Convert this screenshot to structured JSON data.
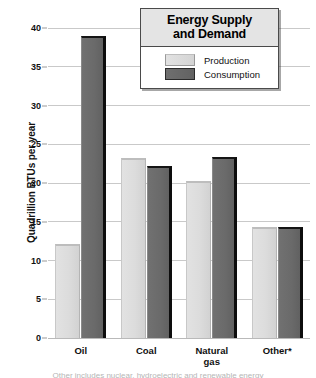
{
  "chart_data": {
    "type": "bar",
    "title": "Energy Supply and Demand",
    "title_line1": "Energy Supply",
    "title_line2": "and Demand",
    "xlabel": "",
    "ylabel": "Quadrillion BTUs per year",
    "categories": [
      "Oil",
      "Coal",
      "Natural gas",
      "Other*"
    ],
    "category_labels": [
      {
        "line1": "Oil",
        "line2": ""
      },
      {
        "line1": "Coal",
        "line2": ""
      },
      {
        "line1": "Natural",
        "line2": "gas"
      },
      {
        "line1": "Other*",
        "line2": ""
      }
    ],
    "series": [
      {
        "name": "Production",
        "color": "#d8d8d8",
        "values": [
          12.1,
          23.2,
          20.2,
          14.3
        ]
      },
      {
        "name": "Consumption",
        "color": "#666666",
        "values": [
          39.0,
          22.2,
          23.4,
          14.3
        ]
      }
    ],
    "ylim": [
      0,
      40
    ],
    "yticks": [
      0,
      5,
      10,
      15,
      20,
      25,
      30,
      35,
      40
    ],
    "ytick_labels": [
      "0",
      "5",
      "10",
      "15",
      "20",
      "25",
      "30",
      "35",
      "40"
    ],
    "grid": true,
    "legend_position": "top-right",
    "legend_entries": [
      {
        "label": "Production",
        "swatch": "light-gray"
      },
      {
        "label": "Consumption",
        "swatch": "dark-gray"
      }
    ]
  },
  "footnote": {
    "cut_off_text": "Other includes nuclear, hydroelectric and renewable energy"
  }
}
